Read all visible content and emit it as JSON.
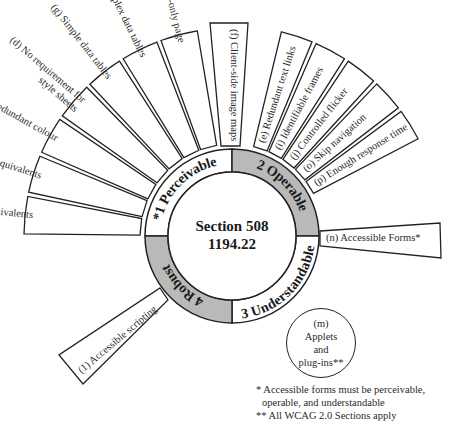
{
  "center": {
    "line1": "Section 508",
    "line2": "1194.22"
  },
  "ring": {
    "fill_shaded": "#b9b9b9",
    "fill_plain": "#ffffff",
    "quadrants": [
      {
        "id": "perceivable",
        "label": "*1 Perceivable",
        "shaded": false
      },
      {
        "id": "operable",
        "label": "2 Operable",
        "shaded": true
      },
      {
        "id": "understandable",
        "label": "3 Understandable",
        "shaded": false
      },
      {
        "id": "robust",
        "label": "4 Robust",
        "shaded": true
      }
    ]
  },
  "perceivable_items": [
    "(a) Text equivalents",
    "(b) Multimedia equivalents",
    "(c) Redundant colour",
    "(d) No requirement for|style sheets",
    "(g) Simple data tables",
    "(h) Complex data tables",
    "(k) Text-only page"
  ],
  "standalone_items": {
    "f": "(f) Client-side image maps",
    "n": "(n) Accessible Forms*",
    "l": "(1) Accessible scripting"
  },
  "operable_items": [
    "(e) Redundant text links",
    "(i) Identifiable frames",
    "(j) Controlled flicker",
    "(o) Skip navigation",
    "(p) Enough response time"
  ],
  "circle_m": {
    "line1": "(m)",
    "line2": "Applets",
    "line3": "and",
    "line4": "plug-ins**"
  },
  "footnotes": {
    "line1": "* Accessible forms must be perceivable,",
    "line2": "operable, and understandable",
    "line3": "** All WCAG 2.0 Sections apply"
  }
}
